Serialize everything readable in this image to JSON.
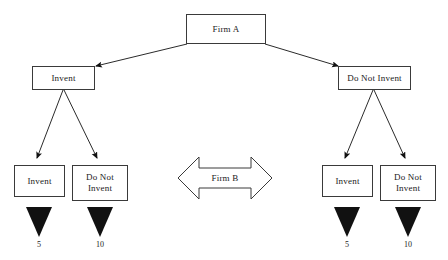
{
  "diagram": {
    "type": "extensive-form-game-tree",
    "title_text": "",
    "background_color": "#ffffff",
    "line_color": "#3a3a3a",
    "text_color": "#1a1a1a"
  },
  "players": {
    "first_mover": "Firm A",
    "second_mover": "Firm B"
  },
  "root": {
    "label": "Firm A",
    "box": {
      "x": 186,
      "y": 14,
      "w": 80,
      "h": 30
    }
  },
  "branches": [
    {
      "id": "left",
      "label": "Invent",
      "box": {
        "x": 32,
        "y": 66,
        "w": 63,
        "h": 24
      },
      "children": [
        {
          "id": "left-invent",
          "label": "Invent",
          "box": {
            "x": 14,
            "y": 165,
            "w": 51,
            "h": 32
          },
          "payoff": "5"
        },
        {
          "id": "left-do-not-invent",
          "label": "Do Not Invent",
          "box": {
            "x": 72,
            "y": 165,
            "w": 56,
            "h": 36
          },
          "payoff": "10"
        }
      ]
    },
    {
      "id": "right",
      "label": "Do Not Invent",
      "box": {
        "x": 338,
        "y": 66,
        "w": 73,
        "h": 24
      },
      "children": [
        {
          "id": "right-invent",
          "label": "Invent",
          "box": {
            "x": 322,
            "y": 165,
            "w": 51,
            "h": 32
          },
          "payoff": "5"
        },
        {
          "id": "right-do-not-invent",
          "label": "Do Not Invent",
          "box": {
            "x": 380,
            "y": 165,
            "w": 56,
            "h": 36
          },
          "payoff": "10"
        }
      ]
    }
  ],
  "center_marker": {
    "label": "Firm B",
    "shape": "double-headed-horizontal-arrow",
    "x": 178,
    "y": 157,
    "w": 94,
    "h": 42
  },
  "payoff_values": {
    "left_invent": "5",
    "left_do_not_invent": "10",
    "right_invent": "5",
    "right_do_not_invent": "10"
  }
}
